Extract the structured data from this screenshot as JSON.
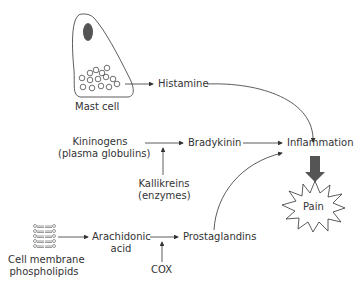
{
  "nodes": {
    "mast_cell": "Mast cell",
    "histamine": "Histamine",
    "kininogens_1": "Kininogens",
    "kininogens_2": "(plasma globulins)",
    "bradykinin": "Bradykinin",
    "kallikreins_1": "Kallikreins",
    "kallikreins_2": "(enzymes)",
    "inflammation": "Inflammation",
    "pain": "Pain",
    "membrane_1": "Cell membrane",
    "membrane_2": "phospholipids",
    "arachidonic_1": "Arachidonic",
    "arachidonic_2": "acid",
    "prostaglandins": "Prostaglandins",
    "cox": "COX"
  },
  "edges": [
    {
      "from": "Mast cell",
      "to": "Histamine"
    },
    {
      "from": "Histamine",
      "to": "Inflammation"
    },
    {
      "from": "Kininogens",
      "to": "Bradykinin"
    },
    {
      "from": "Kallikreins",
      "to": "Kininogens-Bradykinin arrow"
    },
    {
      "from": "Bradykinin",
      "to": "Inflammation"
    },
    {
      "from": "Cell membrane phospholipids",
      "to": "Arachidonic acid"
    },
    {
      "from": "Arachidonic acid",
      "to": "Prostaglandins"
    },
    {
      "from": "COX",
      "to": "Arachidonic-Prostaglandins arrow"
    },
    {
      "from": "Prostaglandins",
      "to": "Inflammation"
    },
    {
      "from": "Inflammation",
      "to": "Pain"
    }
  ],
  "colors": {
    "line": "#333333",
    "nucleus": "#555555",
    "thick_arrow": "#555555"
  }
}
